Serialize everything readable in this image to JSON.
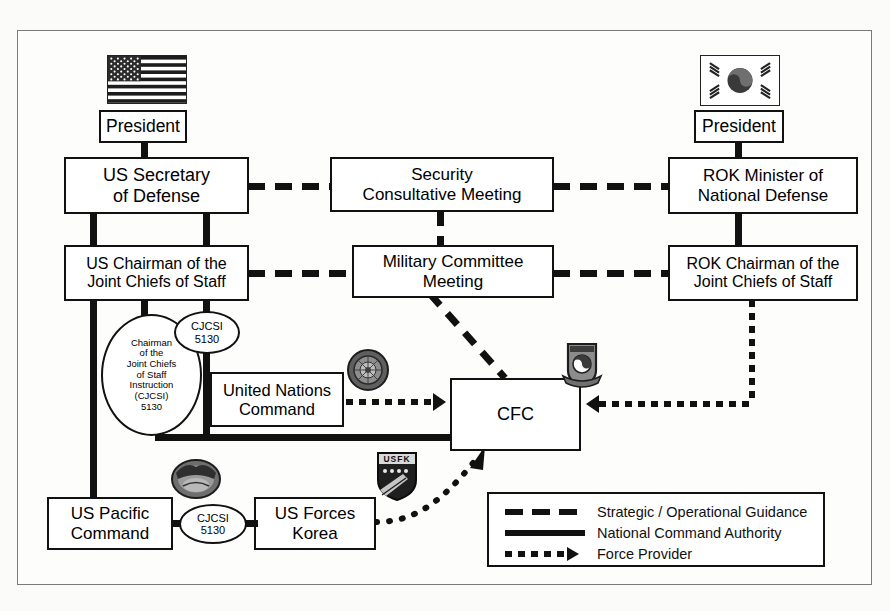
{
  "diagram": {
    "boxes": [
      {
        "id": "us_president",
        "label": "President"
      },
      {
        "id": "rok_president",
        "label": "President"
      },
      {
        "id": "us_secdef",
        "label": "US Secretary\nof Defense"
      },
      {
        "id": "scm",
        "label": "Security\nConsultative Meeting"
      },
      {
        "id": "rok_mnd",
        "label": "ROK Minister of\nNational Defense"
      },
      {
        "id": "us_cjcs",
        "label": "US Chairman of the\nJoint Chiefs of Staff"
      },
      {
        "id": "mcm",
        "label": "Military Committee\nMeeting"
      },
      {
        "id": "rok_cjcs",
        "label": "ROK Chairman of the\nJoint Chiefs of Staff"
      },
      {
        "id": "unc",
        "label": "United Nations\nCommand"
      },
      {
        "id": "cfc",
        "label": "CFC"
      },
      {
        "id": "uspacom",
        "label": "US Pacific\nCommand"
      },
      {
        "id": "usfk",
        "label": "US Forces\nKorea"
      }
    ],
    "ovals": [
      {
        "id": "cjcsi_big",
        "label": "Chairman\nof the\nJoint Chiefs\nof Staff\nInstruction\n(CJCSI)\n5130"
      },
      {
        "id": "cjcsi_small",
        "label": "CJCSI\n5130"
      },
      {
        "id": "cjcsi_pac",
        "label": "CJCSI\n5130"
      }
    ],
    "emblems": [
      {
        "id": "us_flag",
        "name": "united-states-flag"
      },
      {
        "id": "rok_flag",
        "name": "republic-of-korea-flag"
      },
      {
        "id": "un_emblem",
        "name": "united-nations-emblem"
      },
      {
        "id": "rokjcs_crest",
        "name": "rok-joint-chiefs-of-staff-crest"
      },
      {
        "id": "pacom_crest",
        "name": "us-pacific-command-crest"
      },
      {
        "id": "usfk_patch",
        "name": "us-forces-korea-shield-patch"
      }
    ],
    "legend": {
      "items": [
        {
          "style": "dashed",
          "label": "Strategic / Operational Guidance"
        },
        {
          "style": "solid",
          "label": "National Command Authority"
        },
        {
          "style": "dotted-arrow",
          "label": "Force Provider"
        }
      ]
    },
    "colors": {
      "line": "#111111",
      "box_fill": "#ffffff",
      "frame": "#7a7a78",
      "page": "#fbfbfa"
    }
  }
}
